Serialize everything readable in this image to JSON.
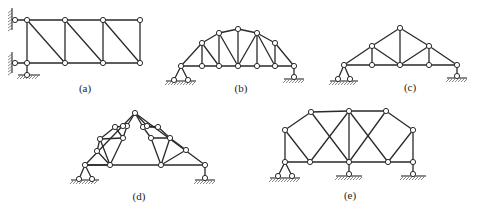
{
  "figure": {
    "panels": [
      {
        "id": "a",
        "label": "(a)",
        "label_pos": [
          85,
          92
        ],
        "nodes": [
          [
            27,
            20
          ],
          [
            65,
            20
          ],
          [
            103,
            20
          ],
          [
            140,
            20
          ],
          [
            27,
            63
          ],
          [
            65,
            63
          ],
          [
            103,
            63
          ],
          [
            140,
            63
          ],
          [
            15,
            20
          ],
          [
            15,
            63
          ],
          [
            27,
            75
          ]
        ],
        "members": [
          [
            0,
            1
          ],
          [
            1,
            2
          ],
          [
            2,
            3
          ],
          [
            4,
            5
          ],
          [
            5,
            6
          ],
          [
            6,
            7
          ],
          [
            0,
            4
          ],
          [
            1,
            5
          ],
          [
            2,
            6
          ],
          [
            3,
            7
          ],
          [
            0,
            5
          ],
          [
            1,
            6
          ],
          [
            2,
            7
          ],
          [
            8,
            0
          ],
          [
            9,
            4
          ],
          [
            4,
            10
          ]
        ],
        "walls": [
          {
            "x": 15,
            "y1": 8,
            "y2": 30
          },
          {
            "x": 15,
            "y1": 52,
            "y2": 73
          }
        ],
        "grounds": [
          {
            "x1": 18,
            "x2": 40,
            "y": 75
          }
        ]
      },
      {
        "id": "b",
        "label": "(b)",
        "label_pos": [
          241,
          92
        ],
        "nodes": [
          [
            181,
            66
          ],
          [
            202,
            66
          ],
          [
            219,
            66
          ],
          [
            238,
            66
          ],
          [
            257,
            66
          ],
          [
            275,
            66
          ],
          [
            294,
            66
          ],
          [
            202,
            43
          ],
          [
            219,
            33
          ],
          [
            238,
            29
          ],
          [
            257,
            33
          ],
          [
            275,
            43
          ],
          [
            174,
            80
          ],
          [
            188,
            80
          ],
          [
            294,
            77
          ]
        ],
        "members": [
          [
            0,
            1
          ],
          [
            1,
            2
          ],
          [
            2,
            3
          ],
          [
            3,
            4
          ],
          [
            4,
            5
          ],
          [
            5,
            6
          ],
          [
            0,
            7
          ],
          [
            7,
            8
          ],
          [
            8,
            9
          ],
          [
            9,
            10
          ],
          [
            10,
            11
          ],
          [
            11,
            6
          ],
          [
            1,
            7
          ],
          [
            2,
            8
          ],
          [
            3,
            9
          ],
          [
            4,
            10
          ],
          [
            5,
            11
          ],
          [
            7,
            2
          ],
          [
            8,
            3
          ],
          [
            3,
            10
          ],
          [
            10,
            5
          ],
          [
            0,
            12
          ],
          [
            0,
            13
          ],
          [
            6,
            14
          ]
        ],
        "grounds": [
          {
            "x1": 166,
            "x2": 196,
            "y": 81
          },
          {
            "x1": 284,
            "x2": 304,
            "y": 79
          }
        ]
      },
      {
        "id": "c",
        "label": "(c)",
        "label_pos": [
          410,
          91
        ],
        "nodes": [
          [
            344,
            65
          ],
          [
            372,
            65
          ],
          [
            400,
            65
          ],
          [
            429,
            65
          ],
          [
            457,
            65
          ],
          [
            372,
            46
          ],
          [
            400,
            28
          ],
          [
            429,
            46
          ],
          [
            338,
            79
          ],
          [
            350,
            79
          ],
          [
            457,
            76
          ]
        ],
        "members": [
          [
            0,
            1
          ],
          [
            1,
            2
          ],
          [
            2,
            3
          ],
          [
            3,
            4
          ],
          [
            0,
            5
          ],
          [
            5,
            6
          ],
          [
            6,
            7
          ],
          [
            7,
            4
          ],
          [
            1,
            5
          ],
          [
            2,
            6
          ],
          [
            3,
            7
          ],
          [
            5,
            2
          ],
          [
            2,
            7
          ],
          [
            0,
            8
          ],
          [
            0,
            9
          ],
          [
            4,
            10
          ]
        ],
        "grounds": [
          {
            "x1": 330,
            "x2": 358,
            "y": 81
          },
          {
            "x1": 447,
            "x2": 467,
            "y": 78
          }
        ]
      },
      {
        "id": "d",
        "label": "(d)",
        "label_pos": [
          139,
          200
        ],
        "nodes": [
          [
            85,
            165
          ],
          [
            110,
            165
          ],
          [
            161,
            165
          ],
          [
            205,
            165
          ],
          [
            135,
            113
          ],
          [
            85,
            165
          ],
          [
            97,
            151
          ],
          [
            100,
            139
          ],
          [
            123,
            138
          ],
          [
            115,
            127
          ],
          [
            127,
            126
          ],
          [
            123,
            126
          ],
          [
            143,
            127
          ],
          [
            147,
            126
          ],
          [
            158,
            127
          ],
          [
            151,
            138
          ],
          [
            170,
            138
          ],
          [
            186,
            150
          ],
          [
            79,
            179
          ],
          [
            92,
            179
          ],
          [
            205,
            178
          ]
        ],
        "members": [
          [
            0,
            3
          ],
          [
            0,
            4
          ],
          [
            4,
            3
          ],
          [
            0,
            1
          ],
          [
            6,
            1
          ],
          [
            7,
            1
          ],
          [
            8,
            1
          ],
          [
            6,
            7
          ],
          [
            7,
            8
          ],
          [
            7,
            9
          ],
          [
            9,
            10
          ],
          [
            10,
            8
          ],
          [
            9,
            8
          ],
          [
            10,
            4
          ],
          [
            4,
            13
          ],
          [
            13,
            14
          ],
          [
            14,
            12
          ],
          [
            12,
            4
          ],
          [
            13,
            12
          ],
          [
            12,
            15
          ],
          [
            15,
            16
          ],
          [
            16,
            14
          ],
          [
            15,
            2
          ],
          [
            16,
            2
          ],
          [
            17,
            2
          ],
          [
            16,
            17
          ],
          [
            0,
            18
          ],
          [
            0,
            19
          ],
          [
            3,
            20
          ]
        ],
        "grounds": [
          {
            "x1": 71,
            "x2": 99,
            "y": 180
          },
          {
            "x1": 195,
            "x2": 215,
            "y": 180
          }
        ]
      },
      {
        "id": "e",
        "label": "(e)",
        "label_pos": [
          350,
          199
        ],
        "nodes": [
          [
            285,
            162
          ],
          [
            310,
            162
          ],
          [
            349,
            162
          ],
          [
            388,
            162
          ],
          [
            413,
            162
          ],
          [
            285,
            130
          ],
          [
            311,
            112
          ],
          [
            349,
            111
          ],
          [
            386,
            111
          ],
          [
            413,
            130
          ],
          [
            278,
            176
          ],
          [
            292,
            176
          ],
          [
            349,
            174
          ],
          [
            413,
            174
          ]
        ],
        "members": [
          [
            0,
            1
          ],
          [
            1,
            2
          ],
          [
            2,
            3
          ],
          [
            3,
            4
          ],
          [
            0,
            5
          ],
          [
            5,
            6
          ],
          [
            6,
            7
          ],
          [
            7,
            8
          ],
          [
            8,
            9
          ],
          [
            9,
            4
          ],
          [
            5,
            1
          ],
          [
            6,
            2
          ],
          [
            1,
            7
          ],
          [
            7,
            2
          ],
          [
            2,
            8
          ],
          [
            7,
            3
          ],
          [
            3,
            9
          ],
          [
            0,
            10
          ],
          [
            0,
            11
          ],
          [
            2,
            12
          ],
          [
            4,
            13
          ]
        ],
        "grounds": [
          {
            "x1": 270,
            "x2": 300,
            "y": 178
          },
          {
            "x1": 336,
            "x2": 362,
            "y": 176
          },
          {
            "x1": 401,
            "x2": 426,
            "y": 176
          }
        ]
      }
    ]
  }
}
